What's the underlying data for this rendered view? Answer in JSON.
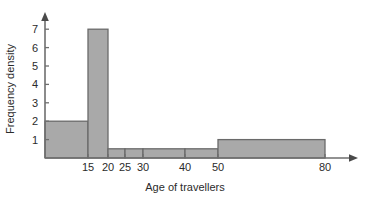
{
  "chart_data": {
    "type": "bar",
    "title": "",
    "xlabel": "Age of travellers",
    "ylabel": "Frequency density",
    "grid": false,
    "legend": null,
    "ylim": [
      0,
      7.6
    ],
    "xlim": [
      0,
      82
    ],
    "y_ticks": [
      1,
      2,
      3,
      4,
      5,
      6,
      7
    ],
    "x_ticks": [
      15,
      20,
      25,
      30,
      40,
      50,
      80
    ],
    "x_axis_scale": "non-linear",
    "bar_edges": [
      0,
      15,
      20,
      25,
      30,
      40,
      50,
      80
    ],
    "categories": [
      "0-15",
      "15-20",
      "20-25",
      "25-30",
      "30-40",
      "40-50",
      "50-80"
    ],
    "values": [
      2,
      7,
      0.5,
      0.5,
      0.5,
      0.5,
      1
    ],
    "bars": [
      {
        "label": "0-15",
        "x0": 0,
        "x1": 15,
        "height": 2
      },
      {
        "label": "15-20",
        "x0": 15,
        "x1": 20,
        "height": 7
      },
      {
        "label": "20-25",
        "x0": 20,
        "x1": 25,
        "height": 0.5
      },
      {
        "label": "25-30",
        "x0": 25,
        "x1": 30,
        "height": 0.5
      },
      {
        "label": "30-40",
        "x0": 30,
        "x1": 40,
        "height": 0.5
      },
      {
        "label": "40-50",
        "x0": 40,
        "x1": 50,
        "height": 0.5
      },
      {
        "label": "50-80",
        "x0": 50,
        "x1": 80,
        "height": 1
      }
    ],
    "colors": {
      "bar_fill": "#a9a9a9",
      "bar_stroke": "#6a6a6a",
      "axis": "#6e6e6e",
      "text": "#2b2b2b",
      "background": "#ffffff"
    }
  },
  "ytick_labels": [
    "1",
    "2",
    "3",
    "4",
    "5",
    "6",
    "7"
  ],
  "xtick_labels": [
    "15",
    "20",
    "25",
    "30",
    "40",
    "50",
    "80"
  ],
  "axis_titles": {
    "x": "Age of travellers",
    "y": "Frequency density"
  }
}
